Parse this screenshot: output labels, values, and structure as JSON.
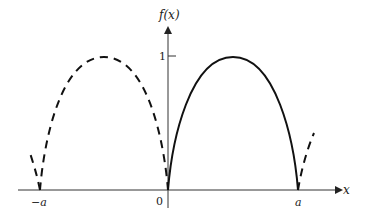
{
  "figure": {
    "y_axis_label": "f(x)",
    "x_axis_label": "x",
    "y_tick_label": "1",
    "x_tick_labels": {
      "neg_a": "−a",
      "zero": "0",
      "a": "a"
    },
    "curves": [
      {
        "name": "f(x) on [0, a]",
        "style": "solid",
        "x_range": [
          "0",
          "a"
        ],
        "peak": 1
      },
      {
        "name": "periodic extension",
        "style": "dashed",
        "x_range": [
          "-a",
          "0"
        ],
        "peak": 1
      },
      {
        "name": "extension left of -a",
        "style": "dashed"
      },
      {
        "name": "extension right of a",
        "style": "dashed"
      }
    ],
    "colors": {
      "ink": "#111111",
      "axis": "#333333"
    }
  }
}
